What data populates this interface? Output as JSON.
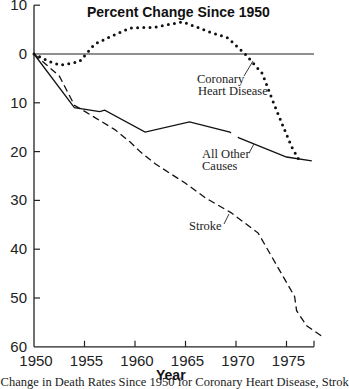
{
  "chart_data": {
    "type": "line",
    "title": "Percent Change Since 1950",
    "xlabel": "Year",
    "ylabel": "",
    "xlim": [
      1950,
      1978
    ],
    "ylim": [
      10,
      -60
    ],
    "y_direction": "positive values above zero line = increase; axis labels show magnitude (10, 0, 10 ... 60)",
    "x_ticks": [
      1950,
      1955,
      1960,
      1965,
      1970,
      1975
    ],
    "x_tick_labels": [
      "1950",
      "1955",
      "1960",
      "1965",
      "1970",
      "1975"
    ],
    "y_ticks": [
      10,
      0,
      -10,
      -20,
      -30,
      -40,
      -50,
      -60
    ],
    "y_tick_labels": [
      "10",
      "0",
      "10",
      "20",
      "30",
      "40",
      "50",
      "60"
    ],
    "grid": false,
    "reference_line": {
      "y": 0
    },
    "series": [
      {
        "name": "Coronary Heart Disease",
        "style": "dotted",
        "x": [
          1950,
          1951.5,
          1952.6,
          1954.5,
          1956,
          1957.5,
          1959.5,
          1962,
          1964.7,
          1967.4,
          1969.2,
          1970.9,
          1972.6,
          1973.6,
          1974.6,
          1975.5,
          1976.4
        ],
        "values": [
          0,
          -1.5,
          -2.3,
          -1.6,
          2.0,
          3.5,
          5.3,
          5.5,
          6.6,
          4.5,
          3.3,
          0,
          -4.0,
          -9.4,
          -14.5,
          -19.0,
          -22.3
        ]
      },
      {
        "name": "All Other Causes",
        "style": "solid",
        "x": [
          1950,
          1954,
          1956.5,
          1957,
          1961,
          1965.4,
          1969.4,
          1970.3,
          1975,
          1977.5
        ],
        "values": [
          0,
          -11.0,
          -11.8,
          -11.5,
          -16.0,
          -13.9,
          -16.0,
          -17.2,
          -21.1,
          -21.9
        ]
      },
      {
        "name": "Stroke",
        "style": "dashed",
        "x": [
          1950,
          1952.5,
          1954,
          1956,
          1958,
          1959.5,
          1960.5,
          1962,
          1965,
          1967,
          1969.5,
          1972.2,
          1975.8,
          1976,
          1977,
          1978.5
        ],
        "values": [
          0,
          -4.5,
          -10.5,
          -13.0,
          -15.5,
          -18.0,
          -20.0,
          -22.5,
          -26.5,
          -29.5,
          -32.5,
          -36.7,
          -49.7,
          -52.6,
          -55.7,
          -57.8
        ]
      }
    ],
    "annotations": [
      {
        "text": "Coronary Heart Disease",
        "lines": [
          "Coronary",
          "Heart Disease"
        ],
        "points_to": "Coronary Heart Disease"
      },
      {
        "text": "All Other Causes",
        "lines": [
          "All Other",
          "Causes"
        ],
        "points_to": "All Other Causes"
      },
      {
        "text": "Stroke",
        "lines": [
          "Stroke"
        ],
        "points_to": "Stroke"
      }
    ],
    "caption": "t Change in Death Rates Since 1950 for Coronary Heart Disease, Strok"
  },
  "labels": {
    "title": "Percent Change Since 1950",
    "xlabel": "Year",
    "chd_line1": "Coronary",
    "chd_line2": "Heart Disease",
    "other_line1": "All Other",
    "other_line2": "Causes",
    "stroke": "Stroke",
    "caption": "t Change in Death Rates Since 1950 for Coronary Heart Disease, Strok"
  }
}
